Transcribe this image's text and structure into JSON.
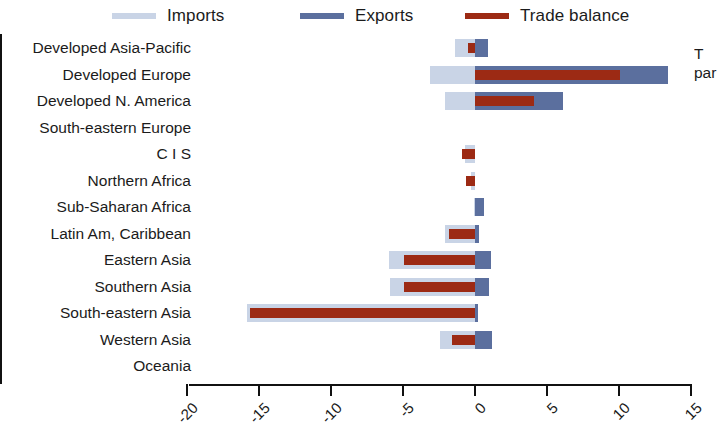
{
  "legend": {
    "items": [
      {
        "label": "Imports",
        "color": "#c9d4e6",
        "key": "imports"
      },
      {
        "label": "Exports",
        "color": "#5b6f9e",
        "key": "exports"
      },
      {
        "label": "Trade balance",
        "color": "#9c2a14",
        "key": "balance"
      }
    ]
  },
  "annotation": {
    "line1": "T",
    "line2": "par"
  },
  "axis": {
    "ticks": [
      -20,
      -15,
      -10,
      -5,
      0,
      5,
      10,
      15
    ],
    "tick_labels": [
      "-20",
      "-15",
      "-10",
      "-5",
      "0",
      "5",
      "10",
      "15"
    ],
    "min": -20,
    "max": 15
  },
  "chart_data": {
    "type": "bar",
    "orientation": "horizontal",
    "title": "",
    "subtitle": "",
    "xlabel": "",
    "ylabel": "",
    "xlim": [
      -20,
      15
    ],
    "grid": false,
    "legend_position": "top",
    "zero_line": true,
    "categories": [
      "Developed Asia-Pacific",
      "Developed Europe",
      "Developed N. America",
      "South-eastern Europe",
      "C I S",
      "Northern Africa",
      "Sub-Saharan Africa",
      "Latin Am, Caribbean",
      "Eastern Asia",
      "Southern Asia",
      "South-eastern Asia",
      "Western Asia",
      "Oceania"
    ],
    "series": [
      {
        "name": "Imports",
        "color": "#c9d4e6",
        "values": [
          -1.4,
          -3.1,
          -2.1,
          0.0,
          -0.7,
          -0.3,
          -0.1,
          -2.1,
          -6.0,
          -5.9,
          -15.8,
          -2.4,
          0.0
        ]
      },
      {
        "name": "Exports",
        "color": "#5b6f9e",
        "values": [
          0.9,
          13.4,
          6.1,
          0.0,
          0.0,
          0.0,
          0.6,
          0.3,
          1.1,
          1.0,
          0.2,
          1.2,
          0.0
        ]
      },
      {
        "name": "Trade balance",
        "color": "#9c2a14",
        "values": [
          -0.5,
          10.1,
          4.1,
          0.0,
          -0.9,
          -0.6,
          0.0,
          -1.8,
          -4.9,
          -4.9,
          -15.6,
          -1.6,
          0.0
        ]
      }
    ]
  }
}
